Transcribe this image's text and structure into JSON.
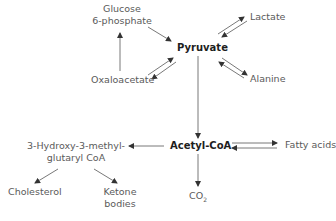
{
  "diagram": {
    "nodes": {
      "glucose6p_line1": "Glucose",
      "glucose6p_line2": "6-phosphate",
      "pyruvate": "Pyruvate",
      "lactate": "Lactate",
      "oxaloacetate": "Oxaloacetate",
      "alanine": "Alanine",
      "acetylcoa": "Acetyl-CoA",
      "fattyacids": "Fatty acids",
      "hmgcoa_line1": "3-Hydroxy-3-methyl-",
      "hmgcoa_line2": "glutaryl CoA",
      "cholesterol": "Cholesterol",
      "ketone_line1": "Ketone",
      "ketone_line2": "bodies",
      "co2_main": "CO",
      "co2_sub": "2"
    },
    "edges": [
      {
        "from": "Glucose 6-phosphate",
        "to": "Pyruvate",
        "type": "one-way"
      },
      {
        "from": "Oxaloacetate",
        "to": "Glucose 6-phosphate",
        "type": "one-way"
      },
      {
        "from": "Pyruvate",
        "to": "Oxaloacetate",
        "type": "reversible"
      },
      {
        "from": "Pyruvate",
        "to": "Lactate",
        "type": "reversible"
      },
      {
        "from": "Pyruvate",
        "to": "Alanine",
        "type": "reversible"
      },
      {
        "from": "Pyruvate",
        "to": "Acetyl-CoA",
        "type": "one-way"
      },
      {
        "from": "Acetyl-CoA",
        "to": "Fatty acids",
        "type": "reversible"
      },
      {
        "from": "Acetyl-CoA",
        "to": "3-Hydroxy-3-methyl-glutaryl CoA",
        "type": "one-way"
      },
      {
        "from": "Acetyl-CoA",
        "to": "CO2",
        "type": "one-way"
      },
      {
        "from": "3-Hydroxy-3-methyl-glutaryl CoA",
        "to": "Cholesterol",
        "type": "one-way"
      },
      {
        "from": "3-Hydroxy-3-methyl-glutaryl CoA",
        "to": "Ketone bodies",
        "type": "one-way"
      }
    ],
    "colors": {
      "line": "#444444",
      "text": "#5a5a5a",
      "bold_text": "#1e1e1e"
    }
  }
}
